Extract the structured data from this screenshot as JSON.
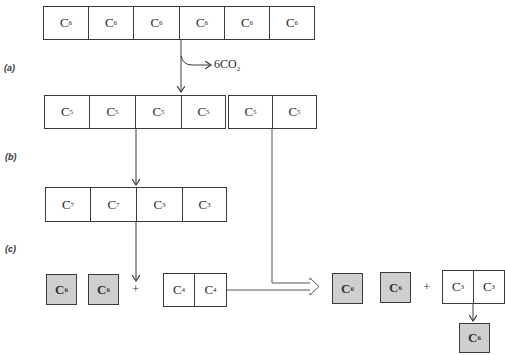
{
  "labels": {
    "a": "(a)",
    "b": "(b)",
    "c": "(c)"
  },
  "co2_label": {
    "prefix": "6CO",
    "sub": "2"
  },
  "rows": {
    "top": [
      {
        "c": "C",
        "n": "6"
      },
      {
        "c": "C",
        "n": "6"
      },
      {
        "c": "C",
        "n": "6"
      },
      {
        "c": "C",
        "n": "6"
      },
      {
        "c": "C",
        "n": "6"
      },
      {
        "c": "C",
        "n": "6"
      }
    ],
    "second_left": [
      {
        "c": "C",
        "n": "5"
      },
      {
        "c": "C",
        "n": "5"
      },
      {
        "c": "C",
        "n": "5"
      },
      {
        "c": "C",
        "n": "5"
      }
    ],
    "second_right": [
      {
        "c": "C",
        "n": "5"
      },
      {
        "c": "C",
        "n": "5"
      }
    ],
    "third": [
      {
        "c": "C",
        "n": "7"
      },
      {
        "c": "C",
        "n": "7"
      },
      {
        "c": "C",
        "n": "3"
      },
      {
        "c": "C",
        "n": "3"
      }
    ],
    "bottom_left_pair": [
      {
        "c": "C",
        "n": "4"
      },
      {
        "c": "C",
        "n": "4"
      }
    ],
    "bottom_right_pair": [
      {
        "c": "C",
        "n": "3"
      },
      {
        "c": "C",
        "n": "3"
      }
    ]
  },
  "gray_boxes": [
    {
      "c": "C",
      "n": "6"
    },
    {
      "c": "C",
      "n": "6"
    },
    {
      "c": "C",
      "n": "6"
    },
    {
      "c": "C",
      "n": "6"
    },
    {
      "c": "C",
      "n": "6"
    }
  ],
  "plus_sign": "+",
  "colors": {
    "gray_box_fill": "#cfcfcf",
    "line": "#3a3a3a"
  }
}
